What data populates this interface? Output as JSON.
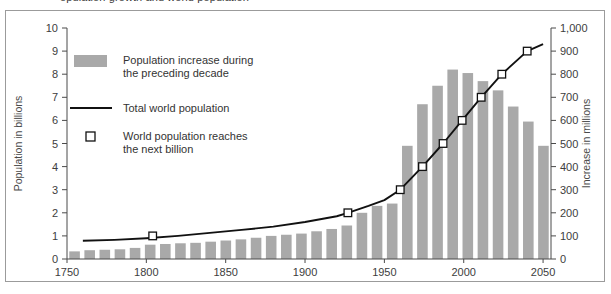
{
  "caption": "opulation growth and world population",
  "chart_data": {
    "type": "bar",
    "title": "",
    "subtitle": "",
    "xlabel": "",
    "ylabel": "Population in billions",
    "y2label": "Increase in millions",
    "grid": false,
    "legend_position": "inside-upper-left",
    "xlim": [
      1750,
      2055
    ],
    "ylim": [
      0,
      10
    ],
    "y2lim": [
      0,
      1000
    ],
    "yticks": [
      0,
      1,
      2,
      3,
      4,
      5,
      6,
      7,
      8,
      9,
      10
    ],
    "ytick_labels": [
      "0",
      "1",
      "2",
      "3",
      "4",
      "5",
      "6",
      "7",
      "8",
      "9",
      "10"
    ],
    "y2ticks": [
      0,
      100,
      200,
      300,
      400,
      500,
      600,
      700,
      800,
      900,
      1000
    ],
    "y2tick_labels": [
      "0",
      "100",
      "200",
      "300",
      "400",
      "500",
      "600",
      "700",
      "800",
      "900",
      "1,000"
    ],
    "xticks": [
      1750,
      1800,
      1850,
      1900,
      1950,
      2000,
      2050
    ],
    "xtick_labels": [
      "1750",
      "1800",
      "1850",
      "1900",
      "1950",
      "2000",
      "2050"
    ],
    "legend": [
      {
        "label_line1": "Population increase during",
        "label_line2": "the preceding decade",
        "marker": "bar-swatch"
      },
      {
        "label_line1": "Total world population",
        "label_line2": "",
        "marker": "line-swatch"
      },
      {
        "label_line1": "World population reaches",
        "label_line2": "the next billion",
        "marker": "open-square-swatch"
      }
    ],
    "series": [
      {
        "name": "Population increase during the preceding decade",
        "type": "bar",
        "axis": "right",
        "unit": "millions",
        "categories": [
          1760,
          1770,
          1780,
          1790,
          1800,
          1810,
          1820,
          1830,
          1840,
          1850,
          1860,
          1870,
          1880,
          1890,
          1900,
          1910,
          1920,
          1930,
          1940,
          1950,
          1960,
          1970,
          1980,
          1990,
          2000,
          2010,
          2020,
          2030,
          2040,
          2050
        ],
        "values": [
          33,
          38,
          40,
          42,
          48,
          62,
          65,
          68,
          70,
          75,
          80,
          85,
          92,
          100,
          105,
          110,
          120,
          130,
          145,
          200,
          230,
          240,
          490,
          670,
          750,
          820,
          805,
          770,
          730,
          660,
          595,
          490
        ]
      },
      {
        "name": "Total world population",
        "type": "line",
        "axis": "left",
        "unit": "billions",
        "x": [
          1760,
          1780,
          1800,
          1820,
          1840,
          1860,
          1880,
          1900,
          1920,
          1927,
          1940,
          1950,
          1960,
          1974,
          1987,
          1999,
          2011,
          2024,
          2040,
          2050
        ],
        "values": [
          0.79,
          0.83,
          0.9,
          1.0,
          1.13,
          1.26,
          1.4,
          1.6,
          1.85,
          2.0,
          2.3,
          2.55,
          3.0,
          4.0,
          5.0,
          6.0,
          7.0,
          8.0,
          9.0,
          9.3
        ]
      },
      {
        "name": "World population reaches the next billion",
        "type": "scatter",
        "axis": "left",
        "unit": "billions",
        "x": [
          1804,
          1927,
          1960,
          1974,
          1987,
          1999,
          2011,
          2024,
          2040
        ],
        "values": [
          1,
          2,
          3,
          4,
          5,
          6,
          7,
          8,
          9
        ]
      }
    ]
  }
}
